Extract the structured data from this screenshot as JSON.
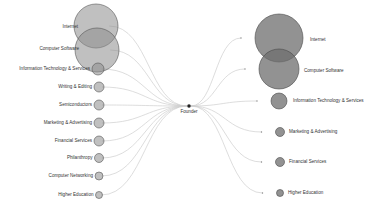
{
  "diagram": {
    "type": "bipartite-flow-bubble",
    "center": {
      "label": "Founder",
      "x": 189,
      "y": 106
    },
    "colors": {
      "left_bubble_fill": "#8c8c8c",
      "left_bubble_stroke": "#555555",
      "right_bubble_fill": "#6e6e6e",
      "right_bubble_stroke": "#4a4a4a",
      "edge": "#cfcfcf",
      "text": "#333333"
    },
    "left_nodes": [
      {
        "label": "Internet",
        "x": 96,
        "y": 26,
        "r": 22,
        "label_y": 27
      },
      {
        "label": "Computer Software",
        "x": 97,
        "y": 50,
        "r": 22,
        "label_y": 49
      },
      {
        "label": "Information Technology & Services",
        "x": 98,
        "y": 69,
        "r": 6,
        "label_y": 69
      },
      {
        "label": "Writing & Editing",
        "x": 99,
        "y": 87,
        "r": 5,
        "label_y": 87
      },
      {
        "label": "Semiconductors",
        "x": 99,
        "y": 105,
        "r": 5,
        "label_y": 105
      },
      {
        "label": "Marketing & Advertising",
        "x": 99,
        "y": 123,
        "r": 5,
        "label_y": 123
      },
      {
        "label": "Financial Services",
        "x": 99,
        "y": 141,
        "r": 5,
        "label_y": 141
      },
      {
        "label": "Philanthropy",
        "x": 99,
        "y": 158,
        "r": 4.5,
        "label_y": 158
      },
      {
        "label": "Computer Networking",
        "x": 99,
        "y": 176,
        "r": 4,
        "label_y": 176
      },
      {
        "label": "Higher Education",
        "x": 99,
        "y": 195,
        "r": 3.5,
        "label_y": 195
      }
    ],
    "right_nodes": [
      {
        "label": "Internet",
        "x": 279,
        "y": 38,
        "r": 24,
        "label_x": 310,
        "label_y": 40
      },
      {
        "label": "Computer Software",
        "x": 279,
        "y": 69,
        "r": 20,
        "label_x": 304,
        "label_y": 71
      },
      {
        "label": "Information Technology & Services",
        "x": 279,
        "y": 101,
        "r": 8,
        "label_x": 293,
        "label_y": 101
      },
      {
        "label": "Marketing & Advertising",
        "x": 280,
        "y": 132,
        "r": 4.5,
        "label_x": 289,
        "label_y": 132
      },
      {
        "label": "Financial Services",
        "x": 280,
        "y": 162,
        "r": 4.5,
        "label_x": 289,
        "label_y": 162
      },
      {
        "label": "Higher Education",
        "x": 280,
        "y": 193,
        "r": 3.5,
        "label_x": 288,
        "label_y": 193
      }
    ]
  }
}
